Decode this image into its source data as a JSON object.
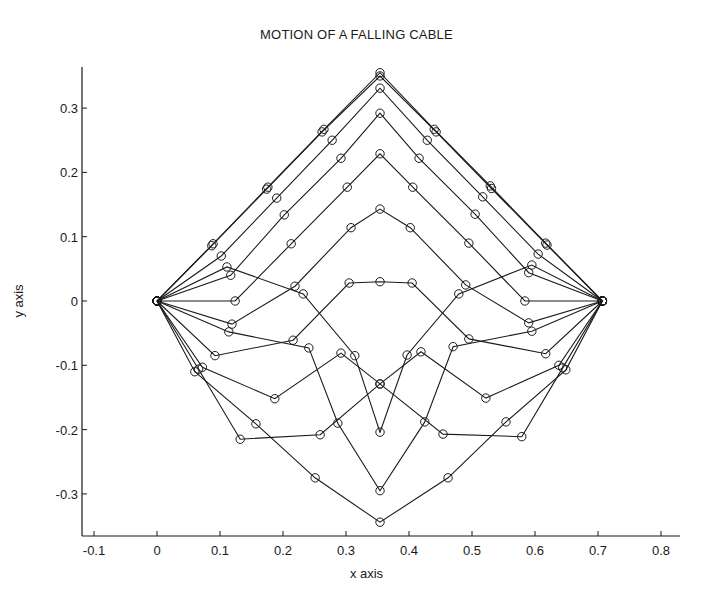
{
  "chart_data": {
    "type": "line",
    "title": "MOTION OF A FALLING CABLE",
    "xlabel": "x axis",
    "ylabel": "y axis",
    "xlim": [
      -0.12,
      0.83
    ],
    "ylim": [
      -0.365,
      0.36
    ],
    "xticks": [
      -0.1,
      0,
      0.1,
      0.2,
      0.3,
      0.4,
      0.5,
      0.6,
      0.7,
      0.8
    ],
    "xtick_labels": [
      "-0.1",
      "0",
      "0.1",
      "0.2",
      "0.3",
      "0.4",
      "0.5",
      "0.6",
      "0.7",
      "0.8"
    ],
    "yticks": [
      0.3,
      0.2,
      0.1,
      0,
      -0.1,
      -0.2,
      -0.3
    ],
    "ytick_labels": [
      "0.3",
      "0.2",
      "0.1",
      "0",
      "-0.1",
      "-0.2",
      "-0.3"
    ],
    "grid": false,
    "legend": null,
    "marker": "open-circle",
    "line_color": "#1a1a1a",
    "series": [
      {
        "name": "t1",
        "points": [
          [
            0,
            0
          ],
          [
            0.089,
            0.089
          ],
          [
            0.176,
            0.177
          ],
          [
            0.265,
            0.267
          ],
          [
            0.354,
            0.355
          ],
          [
            0.44,
            0.267
          ],
          [
            0.529,
            0.179
          ],
          [
            0.617,
            0.09
          ],
          [
            0.707,
            0
          ]
        ]
      },
      {
        "name": "t2",
        "points": [
          [
            0,
            0
          ],
          [
            0.087,
            0.086
          ],
          [
            0.174,
            0.174
          ],
          [
            0.262,
            0.263
          ],
          [
            0.354,
            0.35
          ],
          [
            0.443,
            0.263
          ],
          [
            0.531,
            0.175
          ],
          [
            0.619,
            0.087
          ],
          [
            0.707,
            0
          ]
        ]
      },
      {
        "name": "t3",
        "points": [
          [
            0,
            0
          ],
          [
            0.102,
            0.07
          ],
          [
            0.19,
            0.16
          ],
          [
            0.278,
            0.25
          ],
          [
            0.354,
            0.331
          ],
          [
            0.429,
            0.25
          ],
          [
            0.517,
            0.162
          ],
          [
            0.605,
            0.073
          ],
          [
            0.707,
            0
          ]
        ]
      },
      {
        "name": "t4",
        "points": [
          [
            0,
            0
          ],
          [
            0.117,
            0.04
          ],
          [
            0.202,
            0.134
          ],
          [
            0.292,
            0.222
          ],
          [
            0.354,
            0.292
          ],
          [
            0.416,
            0.222
          ],
          [
            0.505,
            0.135
          ],
          [
            0.59,
            0.044
          ],
          [
            0.707,
            0
          ]
        ]
      },
      {
        "name": "t5",
        "points": [
          [
            0,
            0
          ],
          [
            0.124,
            0.0
          ],
          [
            0.213,
            0.089
          ],
          [
            0.302,
            0.177
          ],
          [
            0.354,
            0.229
          ],
          [
            0.406,
            0.177
          ],
          [
            0.495,
            0.09
          ],
          [
            0.584,
            0.0
          ],
          [
            0.707,
            0
          ]
        ]
      },
      {
        "name": "t6",
        "points": [
          [
            0,
            0
          ],
          [
            0.119,
            -0.036
          ],
          [
            0.219,
            0.023
          ],
          [
            0.308,
            0.114
          ],
          [
            0.354,
            0.143
          ],
          [
            0.402,
            0.114
          ],
          [
            0.49,
            0.025
          ],
          [
            0.59,
            -0.034
          ],
          [
            0.707,
            0
          ]
        ]
      },
      {
        "name": "t7",
        "points": [
          [
            0,
            0
          ],
          [
            0.092,
            -0.085
          ],
          [
            0.216,
            -0.061
          ],
          [
            0.305,
            0.028
          ],
          [
            0.354,
            0.03
          ],
          [
            0.405,
            0.028
          ],
          [
            0.495,
            -0.059
          ],
          [
            0.617,
            -0.082
          ],
          [
            0.707,
            0
          ]
        ]
      },
      {
        "name": "t8",
        "points": [
          [
            0,
            0
          ],
          [
            0.111,
            0.053
          ],
          [
            0.232,
            0.011
          ],
          [
            0.314,
            -0.085
          ],
          [
            0.354,
            -0.204
          ],
          [
            0.397,
            -0.084
          ],
          [
            0.479,
            0.011
          ],
          [
            0.595,
            0.056
          ],
          [
            0.707,
            0
          ]
        ]
      },
      {
        "name": "t9",
        "points": [
          [
            0,
            0
          ],
          [
            0.114,
            -0.048
          ],
          [
            0.241,
            -0.073
          ],
          [
            0.287,
            -0.19
          ],
          [
            0.354,
            -0.295
          ],
          [
            0.425,
            -0.188
          ],
          [
            0.47,
            -0.071
          ],
          [
            0.595,
            -0.047
          ],
          [
            0.707,
            0
          ]
        ]
      },
      {
        "name": "t10",
        "points": [
          [
            0,
            0
          ],
          [
            0.072,
            -0.103
          ],
          [
            0.187,
            -0.152
          ],
          [
            0.292,
            -0.081
          ],
          [
            0.354,
            -0.129
          ],
          [
            0.419,
            -0.079
          ],
          [
            0.522,
            -0.151
          ],
          [
            0.638,
            -0.1
          ],
          [
            0.707,
            0
          ]
        ]
      },
      {
        "name": "t11",
        "points": [
          [
            0,
            0
          ],
          [
            0.066,
            -0.106
          ],
          [
            0.132,
            -0.215
          ],
          [
            0.259,
            -0.208
          ],
          [
            0.354,
            -0.129
          ],
          [
            0.454,
            -0.207
          ],
          [
            0.579,
            -0.211
          ],
          [
            0.644,
            -0.104
          ],
          [
            0.707,
            0
          ]
        ]
      },
      {
        "name": "t12",
        "points": [
          [
            0,
            0
          ],
          [
            0.06,
            -0.11
          ],
          [
            0.157,
            -0.191
          ],
          [
            0.251,
            -0.275
          ],
          [
            0.354,
            -0.344
          ],
          [
            0.462,
            -0.275
          ],
          [
            0.554,
            -0.188
          ],
          [
            0.649,
            -0.107
          ],
          [
            0.707,
            0
          ]
        ]
      }
    ]
  },
  "labels": {
    "title": "MOTION OF A FALLING CABLE",
    "xlabel": "x axis",
    "ylabel": "y axis"
  }
}
